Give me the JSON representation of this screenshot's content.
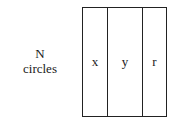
{
  "label": {
    "line1": "N",
    "line2": "circles"
  },
  "table": {
    "columns": [
      "x",
      "y",
      "r"
    ]
  }
}
